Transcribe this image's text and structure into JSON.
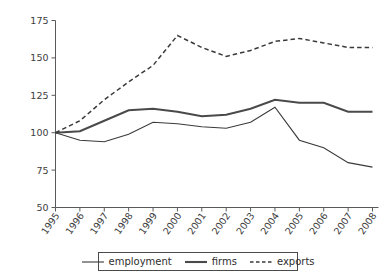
{
  "figure": {
    "caption_fragment": "",
    "background": "#ffffff"
  },
  "axes": {
    "y_ticks": [
      "175",
      "150",
      "125",
      "100",
      "75",
      "50"
    ],
    "x_ticks": [
      "1995",
      "1996",
      "1997",
      "1998",
      "1999",
      "2000",
      "2001",
      "2002",
      "2003",
      "2004",
      "2005",
      "2006",
      "2007",
      "2008"
    ]
  },
  "legend": {
    "position": "bottom-center",
    "items": [
      {
        "label": "employment",
        "style": "solid-thin",
        "color": "#3a3a3a",
        "icon": "line-swatch-icon"
      },
      {
        "label": "firms",
        "style": "solid-thick",
        "color": "#4a4a4a",
        "icon": "line-swatch-icon"
      },
      {
        "label": "exports",
        "style": "dashed",
        "color": "#3a3a3a",
        "icon": "dashed-line-swatch-icon"
      }
    ]
  },
  "chart_data": {
    "type": "line",
    "title": "",
    "subtitle": "",
    "xlabel": "",
    "ylabel": "",
    "x": [
      "1995",
      "1996",
      "1997",
      "1998",
      "1999",
      "2000",
      "2001",
      "2002",
      "2003",
      "2004",
      "2005",
      "2006",
      "2007",
      "2008"
    ],
    "ylim": [
      50,
      175
    ],
    "xlim": [
      "1995",
      "2008"
    ],
    "y_ticks": [
      50,
      75,
      100,
      125,
      150,
      175
    ],
    "grid": false,
    "legend_position": "bottom-center",
    "series": [
      {
        "name": "employment",
        "style": "solid-thin",
        "color": "#3a3a3a",
        "values": [
          100,
          95,
          94,
          99,
          107,
          106,
          104,
          103,
          107,
          117,
          95,
          90,
          80,
          77
        ]
      },
      {
        "name": "firms",
        "style": "solid-thick",
        "color": "#4a4a4a",
        "values": [
          100,
          101,
          108,
          115,
          116,
          114,
          111,
          112,
          116,
          122,
          120,
          120,
          114,
          114
        ]
      },
      {
        "name": "exports",
        "style": "dashed",
        "color": "#3a3a3a",
        "values": [
          100,
          108,
          122,
          134,
          145,
          165,
          157,
          151,
          155,
          161,
          163,
          160,
          157,
          157
        ]
      }
    ]
  }
}
